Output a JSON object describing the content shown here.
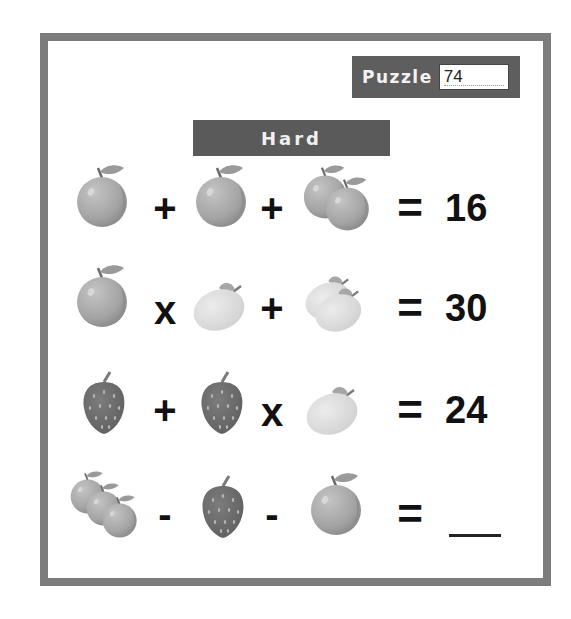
{
  "header": {
    "puzzle_label": "Puzzle",
    "puzzle_number": "74",
    "difficulty": "Hard"
  },
  "colors": {
    "frame": "#7c7c7c",
    "banner": "#5a5a5a",
    "orange": "#a6a6a6",
    "lemon": "#dcdcdc",
    "strawberry": "#6e6e6e",
    "leaf": "#9a9a9a"
  },
  "equations": [
    {
      "terms": [
        "orange",
        "orange",
        "orange-pair"
      ],
      "operators": [
        "+",
        "+"
      ],
      "equals": "=",
      "result": "16"
    },
    {
      "terms": [
        "orange",
        "lemon",
        "lemon-pair"
      ],
      "operators": [
        "x",
        "+"
      ],
      "equals": "=",
      "result": "30"
    },
    {
      "terms": [
        "strawberry",
        "strawberry",
        "lemon"
      ],
      "operators": [
        "+",
        "x"
      ],
      "equals": "=",
      "result": "24"
    },
    {
      "terms": [
        "orange-triple",
        "strawberry",
        "orange"
      ],
      "operators": [
        "-",
        "-"
      ],
      "equals": "=",
      "result": ""
    }
  ]
}
